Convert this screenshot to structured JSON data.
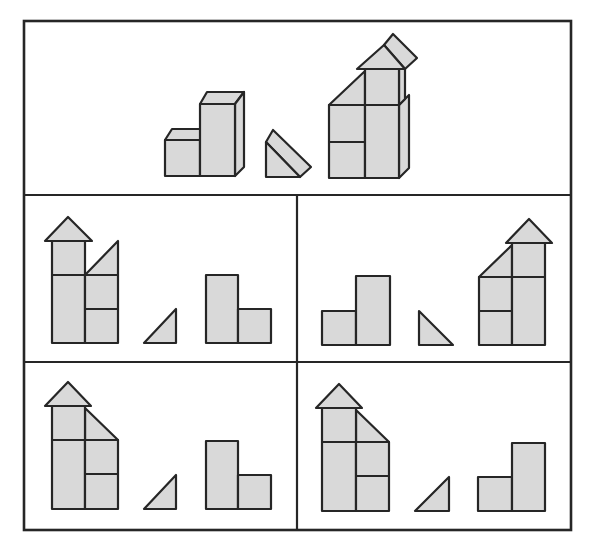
{
  "colors": {
    "background": "#ffffff",
    "block_fill": "#d9d9d9",
    "outline": "#262626"
  },
  "puzzle": {
    "description": "Block assembly puzzle: which arrangement of blocks matches the constructed figure (front view)",
    "reference_panel": {
      "label": "reference",
      "items": [
        "two-block-step (short cube + tall block)",
        "triangular prism",
        "assembled tower with roof prism"
      ]
    },
    "options": [
      {
        "id": "option-1",
        "position": "middle-left",
        "items": [
          "tower with roof, right-side triangle rising right",
          "small triangle (right-angled, rising right)",
          "tall block + short block (tall on left)"
        ]
      },
      {
        "id": "option-2",
        "position": "middle-right",
        "items": [
          "short block + tall block (tall on right)",
          "small triangle (right-angled, falling right)",
          "tower with roof, left-side triangle rising right"
        ]
      },
      {
        "id": "option-3",
        "position": "bottom-left",
        "items": [
          "tower with roof, right-side triangle falling right",
          "small triangle (right-angled, rising right)",
          "tall block + short block (tall on left)"
        ]
      },
      {
        "id": "option-4",
        "position": "bottom-right",
        "items": [
          "tower with roof, right-side triangle falling right",
          "small triangle (right-angled, rising right)",
          "short block + tall block (tall on right)"
        ]
      }
    ]
  }
}
